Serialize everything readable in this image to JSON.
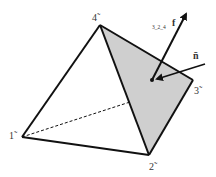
{
  "diagram": {
    "type": "tetrahedron",
    "colors": {
      "edge": "#111111",
      "face_fill": "#cfcfcf",
      "label": "#333333",
      "background": "#ffffff"
    },
    "vertices": [
      {
        "id": "1",
        "label": "1̃",
        "x": 22,
        "y": 137
      },
      {
        "id": "2",
        "label": "2̃",
        "x": 149,
        "y": 155
      },
      {
        "id": "3",
        "label": "3̃",
        "x": 193,
        "y": 80
      },
      {
        "id": "4",
        "label": "4̃",
        "x": 100,
        "y": 25
      }
    ],
    "shaded_face": [
      "4",
      "3",
      "2"
    ],
    "hidden_edge": [
      "1",
      "3"
    ],
    "vectors": {
      "face_vector_label": "3_2_4",
      "face_vector_symbol": "f",
      "normal_label": "n̄"
    }
  }
}
